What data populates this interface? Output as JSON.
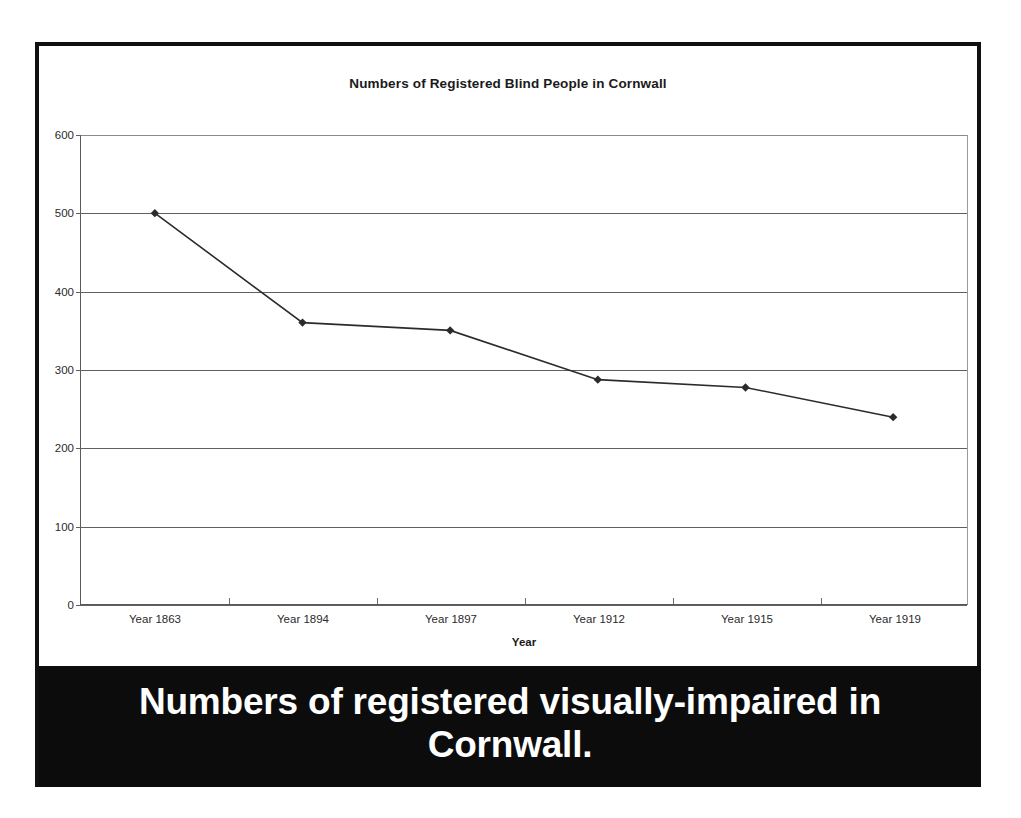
{
  "figure": {
    "chart_title": "Numbers of Registered Blind People in Cornwall",
    "caption": "Numbers of registered visually-impaired in Cornwall.",
    "caption_background": "#0c0c0c",
    "caption_color": "#ffffff",
    "frame_color": "#111111",
    "series_color": "#2b2b2b"
  },
  "chart_data": {
    "type": "line",
    "title": "Numbers of Registered Blind People in Cornwall",
    "xlabel": "Year",
    "ylabel": "",
    "categories": [
      "Year 1863",
      "Year 1894",
      "Year 1897",
      "Year 1912",
      "Year 1915",
      "Year 1919"
    ],
    "values": [
      500,
      360,
      350,
      287,
      277,
      239
    ],
    "ylim": [
      0,
      600
    ],
    "yticks": [
      0,
      100,
      200,
      300,
      400,
      500,
      600
    ],
    "ytick_labels": [
      "0",
      "100",
      "200",
      "300",
      "400",
      "500",
      "600"
    ],
    "grid": true,
    "legend": false,
    "marker": "diamond"
  }
}
